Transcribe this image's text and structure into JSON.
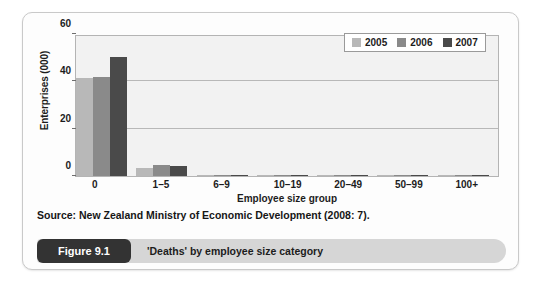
{
  "card": {
    "source_note": "Source: New Zealand Ministry of Economic Development (2008: 7).",
    "figure_badge": "Figure 9.1",
    "caption": "'Deaths' by employee size category"
  },
  "colors": {
    "series_2005": "#b8b8b8",
    "series_2006": "#8a8a8a",
    "series_2007": "#4a4a4a",
    "plot_background": "#f2f2f2",
    "gridline": "#b8b8b8",
    "axis": "#b4b4b4",
    "badge_background": "#333333",
    "caption_background": "#d6d6d6",
    "card_border": "#c9c9c9"
  },
  "chart_data": {
    "type": "bar",
    "title": "",
    "subtitle": "",
    "xlabel": "Employee size group",
    "ylabel": "Enterprises (000)",
    "categories": [
      "0",
      "1–5",
      "6–9",
      "10–19",
      "20–49",
      "50–99",
      "100+"
    ],
    "series": [
      {
        "name": "2005",
        "color": "#b8b8b8",
        "values": [
          41.5,
          3.4,
          0.5,
          0.4,
          0.2,
          0.05,
          0.05
        ]
      },
      {
        "name": "2006",
        "color": "#8a8a8a",
        "values": [
          42.0,
          4.6,
          0.6,
          0.5,
          0.2,
          0.05,
          0.05
        ]
      },
      {
        "name": "2007",
        "color": "#4a4a4a",
        "values": [
          50.2,
          4.3,
          0.6,
          0.6,
          0.2,
          0.05,
          0.05
        ]
      }
    ],
    "ylim": [
      0,
      60
    ],
    "yticks": [
      0,
      20,
      40,
      60
    ],
    "ytick_labels": [
      "0",
      "20",
      "40",
      "60"
    ],
    "grid": true,
    "legend_position": "top-right",
    "legend_entries": [
      "2005",
      "2006",
      "2007"
    ]
  }
}
